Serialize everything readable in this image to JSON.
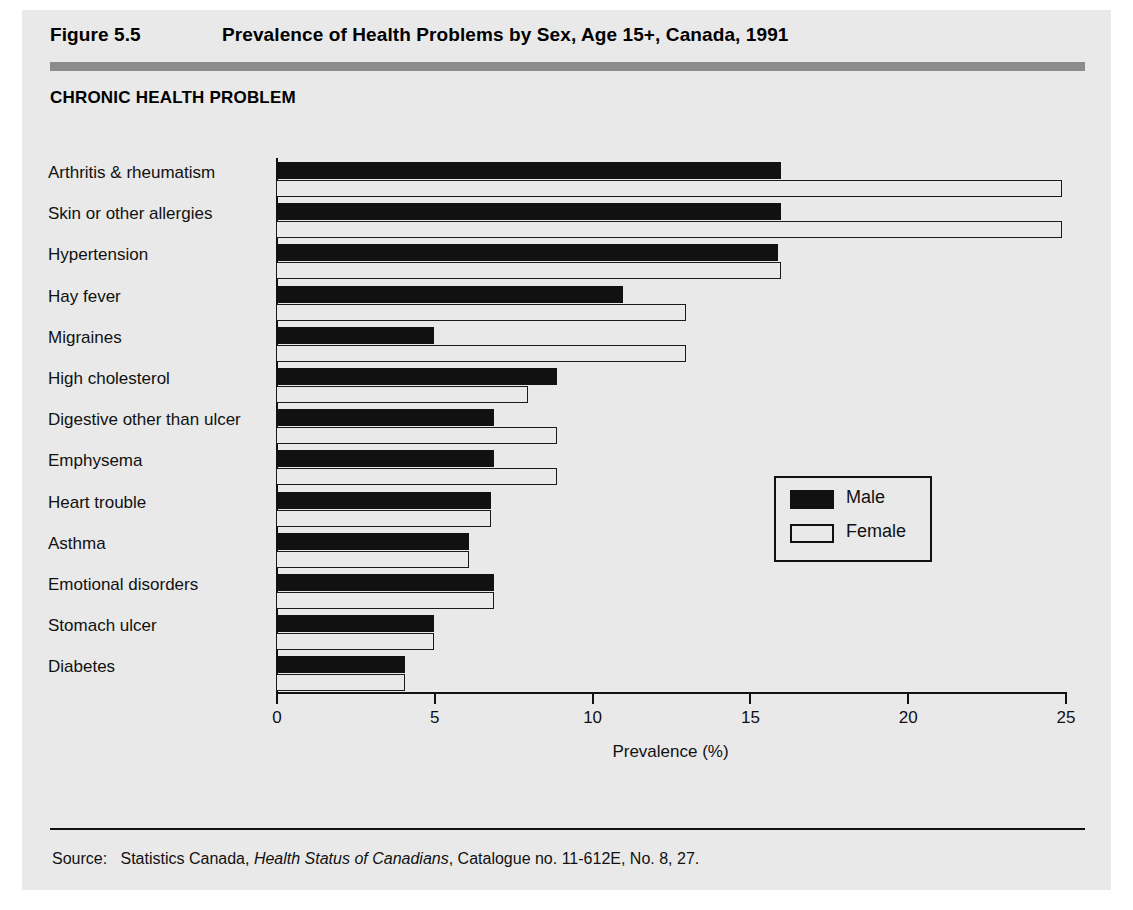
{
  "figure": {
    "number": "Figure 5.5",
    "title": "Prevalence of Health Problems by Sex, Age 15+, Canada, 1991",
    "category_axis_heading": "CHRONIC HEALTH PROBLEM",
    "source_prefix": "Source:",
    "source_text_before": "Statistics Canada,",
    "source_italic": "Health Status of Canadians",
    "source_text_after": ", Catalogue no. 11-612E, No. 8, 27."
  },
  "legend": {
    "position": "inside-right",
    "entries": [
      {
        "label": "Male",
        "color": "#111111",
        "style": "filled"
      },
      {
        "label": "Female",
        "color": "#ffffff",
        "style": "outline"
      }
    ]
  },
  "colors": {
    "panel_background": "#e9e9e9",
    "header_rule": "#8c8c8c",
    "male_bar": "#111111",
    "female_bar": "#e9e9e9",
    "ink": "#111111"
  },
  "chart_data": {
    "type": "bar",
    "orientation": "horizontal",
    "title": "Prevalence of Health Problems by Sex, Age 15+, Canada, 1991",
    "xlabel": "Prevalence (%)",
    "ylabel": "CHRONIC HEALTH PROBLEM",
    "xlim": [
      0,
      25
    ],
    "xticks": [
      0,
      5,
      10,
      15,
      20,
      25
    ],
    "xtick_labels": [
      "0",
      "5",
      "10",
      "15",
      "20",
      "25"
    ],
    "grid": false,
    "legend_position": "center right",
    "categories": [
      "Arthritis & rheumatism",
      "Skin or other allergies",
      "Hypertension",
      "Hay fever",
      "Migraines",
      "High cholesterol",
      "Digestive other than ulcer",
      "Emphysema",
      "Heart trouble",
      "Asthma",
      "Emotional disorders",
      "Stomach ulcer",
      "Diabetes"
    ],
    "series": [
      {
        "name": "Male",
        "values": [
          16.0,
          16.0,
          15.9,
          11.0,
          5.0,
          8.9,
          6.9,
          6.9,
          6.8,
          6.1,
          6.9,
          5.0,
          4.1
        ]
      },
      {
        "name": "Female",
        "values": [
          24.9,
          24.9,
          16.0,
          13.0,
          13.0,
          8.0,
          8.9,
          8.9,
          6.8,
          6.1,
          6.9,
          5.0,
          4.1
        ]
      }
    ]
  }
}
